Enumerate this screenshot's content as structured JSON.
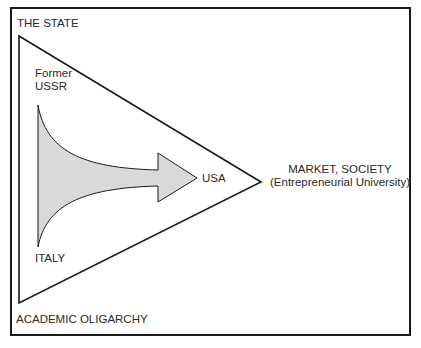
{
  "diagram": {
    "type": "triangle-of-coordination",
    "corners": {
      "top_left": "THE STATE",
      "bottom_left": "ACADEMIC OLIGARCHY",
      "right": {
        "line1": "MARKET, SOCIETY",
        "line2": "(Entrepreneurial University)"
      }
    },
    "arrow": {
      "start_top_label": {
        "line1": "Former",
        "line2": "USSR"
      },
      "start_bottom_label": "ITALY",
      "end_label": "USA",
      "fill_color": "#d9d9d9"
    },
    "line_color": "#1a1a1a"
  }
}
